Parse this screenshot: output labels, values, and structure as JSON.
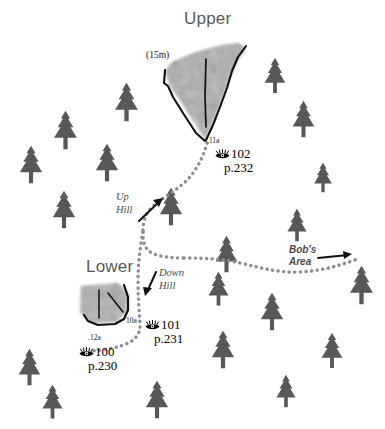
{
  "map": {
    "width": 385,
    "height": 429,
    "background_color": "#ffffff",
    "tree_color": "#58585a",
    "crag_fill_color": "#a8a8a8",
    "outline_color": "#111111",
    "trail_color": "#8e8e90",
    "title_color": "#58585a"
  },
  "areas": [
    {
      "name": "upper-crag",
      "label": "Upper"
    },
    {
      "name": "lower-crag",
      "label": "Lower"
    }
  ],
  "labels": {
    "height_15m": "(15m)",
    "route_11a": ".11a",
    "route_10a": "10a",
    "route_12a": ".12a"
  },
  "photo_refs": [
    {
      "name": "photo-ref-102",
      "icon": "eye-icon",
      "number": "102",
      "page": "p.232"
    },
    {
      "name": "photo-ref-101",
      "icon": "eye-icon",
      "number": "101",
      "page": "p.231"
    },
    {
      "name": "photo-ref-100",
      "icon": "eye-icon",
      "number": "100",
      "page": "p.230"
    }
  ],
  "trail_notes": [
    {
      "name": "up-hill-note",
      "line1": "Up",
      "line2": "Hill"
    },
    {
      "name": "down-hill-note",
      "line1": "Down",
      "line2": "Hill"
    }
  ],
  "direction_note": {
    "name": "bobs-area-note",
    "line1": "Bob's",
    "line2": "Area"
  }
}
